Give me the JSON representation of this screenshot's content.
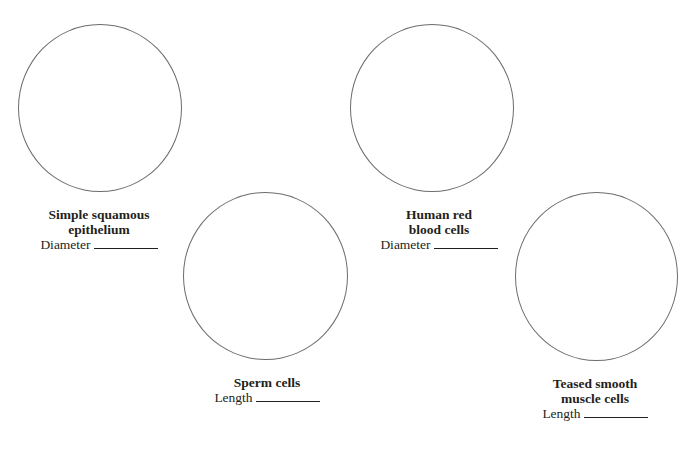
{
  "worksheet": {
    "specimens": [
      {
        "id": "simple-squamous",
        "title_lines": [
          "Simple squamous",
          "epithelium"
        ],
        "measure_label": "Diameter",
        "measure_value": ""
      },
      {
        "id": "sperm",
        "title_lines": [
          "Sperm cells"
        ],
        "measure_label": "Length",
        "measure_value": ""
      },
      {
        "id": "human-rbc",
        "title_lines": [
          "Human red",
          "blood cells"
        ],
        "measure_label": "Diameter",
        "measure_value": ""
      },
      {
        "id": "smooth-muscle",
        "title_lines": [
          "Teased smooth",
          "muscle cells"
        ],
        "measure_label": "Length",
        "measure_value": ""
      }
    ]
  }
}
